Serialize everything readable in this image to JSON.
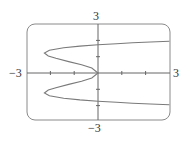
{
  "chart_data": {
    "type": "line",
    "title": "",
    "xlabel": "",
    "ylabel": "",
    "xlim": [
      -3,
      3
    ],
    "ylim": [
      -3,
      3
    ],
    "grid": false,
    "legend": null,
    "tick_labels": {
      "x_min": "−3",
      "x_max": "3",
      "y_min": "−3",
      "y_max": "3"
    },
    "x_ticks": [
      -2,
      -1,
      1,
      2
    ],
    "y_ticks": [
      -2,
      -1,
      1,
      2
    ],
    "series": [
      {
        "name": "x = y^4 - 3y^2",
        "param": "y",
        "points": [
          [
            3.0,
            1.948
          ],
          [
            2.2,
            1.9
          ],
          [
            1.45,
            1.85
          ],
          [
            0.78,
            1.8
          ],
          [
            0.0,
            1.732
          ],
          [
            -0.76,
            1.65
          ],
          [
            -1.44,
            1.55
          ],
          [
            -2.04,
            1.4
          ],
          [
            -2.25,
            1.225
          ],
          [
            -2.09,
            1.05
          ],
          [
            -1.77,
            0.9
          ],
          [
            -1.23,
            0.7
          ],
          [
            -0.69,
            0.5
          ],
          [
            -0.26,
            0.3
          ],
          [
            0.0,
            0.0
          ],
          [
            -0.26,
            -0.3
          ],
          [
            -0.69,
            -0.5
          ],
          [
            -1.23,
            -0.7
          ],
          [
            -1.77,
            -0.9
          ],
          [
            -2.09,
            -1.05
          ],
          [
            -2.25,
            -1.225
          ],
          [
            -2.04,
            -1.4
          ],
          [
            -1.44,
            -1.55
          ],
          [
            -0.76,
            -1.65
          ],
          [
            0.0,
            -1.732
          ],
          [
            0.78,
            -1.8
          ],
          [
            1.45,
            -1.85
          ],
          [
            2.2,
            -1.9
          ],
          [
            3.0,
            -1.948
          ]
        ]
      }
    ]
  },
  "colors": {
    "frame": "#8a8a8a",
    "axis": "#666666",
    "curve": "#7a7a7a",
    "text": "#333333"
  }
}
